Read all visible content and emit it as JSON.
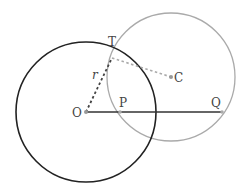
{
  "diagram": {
    "points": {
      "O": {
        "label": "O",
        "x": 86,
        "y": 112
      },
      "P": {
        "label": "P",
        "x": 120,
        "y": 112
      },
      "Q": {
        "label": "Q",
        "x": 222,
        "y": 112
      },
      "T": {
        "label": "T",
        "x": 112,
        "y": 58
      },
      "C": {
        "label": "C",
        "x": 171,
        "y": 77
      }
    },
    "circles": [
      {
        "name": "circle-O",
        "center": "O",
        "radius": 70,
        "color": "#222222"
      },
      {
        "name": "circle-C",
        "center": "C",
        "radius": 64,
        "color": "#aaaaaa"
      }
    ],
    "segments": [
      {
        "name": "segment-OQ",
        "from": "O",
        "to": "Q",
        "style": "solid",
        "color": "#333333"
      },
      {
        "name": "segment-OT",
        "from": "O",
        "to": "T",
        "style": "dashed",
        "color": "#444444",
        "label": "r"
      },
      {
        "name": "segment-TC",
        "from": "T",
        "to": "C",
        "style": "dashed",
        "color": "#aaaaaa"
      }
    ],
    "labels": {
      "O": "O",
      "P": "P",
      "Q": "Q",
      "T": "T",
      "C": "C",
      "r": "r"
    }
  }
}
